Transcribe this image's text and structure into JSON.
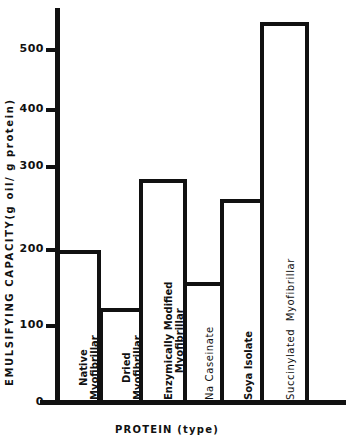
{
  "chart_data": {
    "type": "bar",
    "title": "",
    "xlabel": "PROTEIN (type)",
    "ylabel": "EMULSIFYING CAPACITY(g oil/ g protein)",
    "ylim": [
      0,
      550
    ],
    "yticks": [
      0,
      100,
      200,
      300,
      400,
      500
    ],
    "grid": false,
    "legend": null,
    "categories": [
      "Native Myofibrillar",
      "Dried Myofibrillar",
      "Enzymically Modified Myofibrillar",
      "Na Caseinate",
      "Soya Isolate",
      "Succinylated Myofibrillar"
    ],
    "values": [
      200,
      124,
      286,
      158,
      261,
      547
    ]
  },
  "axis": {
    "x_title": "PROTEIN (type)",
    "y_title": "EMULSIFYING CAPACITY(g oil/ g protein)",
    "tick_labels": [
      "0",
      "100",
      "200",
      "300",
      "400",
      "500"
    ]
  },
  "bars": [
    {
      "label": "Native\nMyofibrillar",
      "style": "bold"
    },
    {
      "label": "Dried\nMyofibrillar",
      "style": "bold"
    },
    {
      "label": "Enzymically Modified\nMyofibrillar",
      "style": "bold"
    },
    {
      "label": "Na Caseinate",
      "style": "light"
    },
    {
      "label": "Soya Isolate",
      "style": "bold"
    },
    {
      "label": "Succinylated  Myofibrillar",
      "style": "light"
    }
  ]
}
